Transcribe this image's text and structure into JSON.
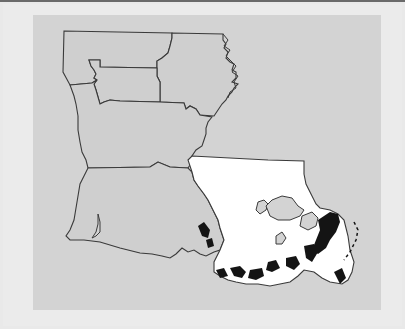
{
  "map": {
    "subject": "Louisiana",
    "style": "grayscale",
    "regions": [
      {
        "name": "northwest",
        "fill": "#cfcfcf"
      },
      {
        "name": "north-central",
        "fill": "#cfcfcf"
      },
      {
        "name": "northeast",
        "fill": "#cfcfcf"
      },
      {
        "name": "central",
        "fill": "#cfcfcf"
      },
      {
        "name": "southwest",
        "fill": "#cfcfcf"
      },
      {
        "name": "southeast",
        "fill": "#ffffff",
        "highlighted": true
      }
    ],
    "colors": {
      "page_background": "#e9e9e9",
      "panel_background": "#d3d3d3",
      "land": "#cfcfcf",
      "highlight": "#ffffff",
      "border": "#3a3a3a",
      "marsh": "#111111"
    },
    "water_bodies": [
      "Lake Pontchartrain",
      "Lake Maurepas",
      "Lake Borgne"
    ]
  }
}
